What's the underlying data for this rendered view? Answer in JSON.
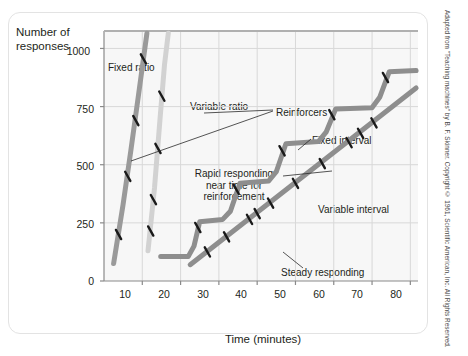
{
  "axes": {
    "y_title": "Number of responses",
    "x_title": "Time (minutes)",
    "y_ticks": [
      "0",
      "250",
      "500",
      "750",
      "1000"
    ],
    "x_ticks": [
      "10",
      "20",
      "30",
      "40",
      "50",
      "60",
      "70",
      "80"
    ]
  },
  "annotations": {
    "fixed_ratio": "Fixed ratio",
    "variable_ratio": "Variable ratio",
    "reinforcers": "Reinforcers",
    "fixed_interval": "Fixed interval",
    "rapid_responding": "Rapid responding near time for reinforcement",
    "variable_interval": "Variable interval",
    "steady_responding": "Steady responding"
  },
  "credit": "Adapted from \"Teaching machines\" by B. F. Skinner. Copyright © 1961, Scientific American, Inc. All Rights Reserved.",
  "colors": {
    "fixed_ratio": "#9a9a9a",
    "variable_ratio": "#d2d2d2",
    "fixed_interval": "#8e8e8e",
    "variable_interval": "#8e8e8e",
    "grid": "#d8d8d8",
    "axis": "#8a8a8a",
    "plot_background": "#f7f7f7",
    "tick_mark": "#1a1a1a"
  },
  "chart_data": {
    "type": "line",
    "title": "",
    "xlabel": "Time (minutes)",
    "ylabel": "Number of responses",
    "xlim": [
      0,
      82
    ],
    "ylim": [
      0,
      1075
    ],
    "grid": true,
    "legend": "inline-annotations",
    "xticks": [
      10,
      20,
      30,
      40,
      50,
      60,
      70,
      80
    ],
    "yticks": [
      0,
      250,
      500,
      750,
      1000
    ],
    "series": [
      {
        "name": "Fixed ratio",
        "color": "#9a9a9a",
        "points": [
          [
            2.5,
            75
          ],
          [
            5.0,
            330
          ],
          [
            7.0,
            560
          ],
          [
            9.0,
            800
          ],
          [
            11.2,
            1065
          ]
        ],
        "reinforcer_marks": [
          [
            3.8,
            200
          ],
          [
            6.2,
            450
          ],
          [
            8.3,
            690
          ],
          [
            10.3,
            955
          ]
        ]
      },
      {
        "name": "Variable ratio",
        "color": "#d2d2d2",
        "points": [
          [
            11.5,
            130
          ],
          [
            13.2,
            400
          ],
          [
            14.6,
            690
          ],
          [
            15.8,
            930
          ],
          [
            16.8,
            1065
          ]
        ],
        "reinforcer_marks": [
          [
            12.2,
            215
          ],
          [
            12.9,
            350
          ],
          [
            14.1,
            570
          ],
          [
            15.1,
            795
          ]
        ]
      },
      {
        "name": "Fixed interval",
        "color": "#8e8e8e",
        "points": [
          [
            14.8,
            105
          ],
          [
            22.0,
            105
          ],
          [
            23.5,
            150
          ],
          [
            25.0,
            255
          ],
          [
            31.0,
            265
          ],
          [
            33.0,
            300
          ],
          [
            35.5,
            420
          ],
          [
            43.0,
            430
          ],
          [
            45.0,
            470
          ],
          [
            47.5,
            590
          ],
          [
            56.0,
            600
          ],
          [
            58.0,
            640
          ],
          [
            60.5,
            740
          ],
          [
            70.0,
            745
          ],
          [
            72.0,
            790
          ],
          [
            74.5,
            900
          ],
          [
            81.5,
            905
          ]
        ],
        "reinforcer_marks": [
          [
            24.5,
            230
          ],
          [
            34.5,
            395
          ],
          [
            46.5,
            560
          ],
          [
            59.5,
            715
          ],
          [
            73.5,
            875
          ]
        ]
      },
      {
        "name": "Variable interval",
        "color": "#8e8e8e",
        "points": [
          [
            22.5,
            70
          ],
          [
            81.5,
            830
          ]
        ],
        "reinforcer_marks": [
          [
            27.0,
            125
          ],
          [
            32.0,
            190
          ],
          [
            38.0,
            265
          ],
          [
            40.0,
            290
          ],
          [
            43.5,
            335
          ],
          [
            50.0,
            420
          ],
          [
            57.0,
            505
          ],
          [
            64.0,
            595
          ],
          [
            67.0,
            635
          ],
          [
            70.5,
            680
          ]
        ]
      }
    ]
  }
}
